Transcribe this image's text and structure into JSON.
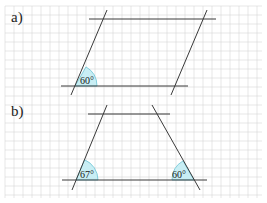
{
  "diagram": {
    "colors": {
      "grid": "#d6d6d6",
      "line": "#3a3a3a",
      "angle_fill": "#c8eef4",
      "angle_stroke": "#6cc4d4"
    },
    "grid": {
      "spacing": 9,
      "x0": 5,
      "y0": 6,
      "x1": 262,
      "y1": 198
    },
    "parts": [
      {
        "label": "a)",
        "shape": "parallelogram",
        "angles": [
          {
            "value": "60°",
            "degrees": 60,
            "vertex": [
              75,
              86
            ]
          }
        ]
      },
      {
        "label": "b)",
        "shape": "trapezoid",
        "angles": [
          {
            "value": "67°",
            "degrees": 67,
            "vertex": [
              76,
              180
            ]
          },
          {
            "value": "60°",
            "degrees": 60,
            "vertex": [
              194,
              180
            ]
          }
        ]
      }
    ]
  }
}
